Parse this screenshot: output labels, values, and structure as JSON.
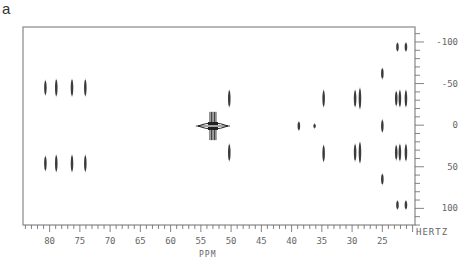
{
  "panel_label": "a",
  "chart_data": {
    "type": "scatter",
    "title": "",
    "subtitle": "2D NMR contour plot (J-resolved)",
    "xlabel": "PPM",
    "ylabel": "HERTZ",
    "xlim": [
      84.4,
      19.6
    ],
    "ylim": [
      -118,
      120
    ],
    "x_reversed": true,
    "x_ticks": [
      80,
      75,
      70,
      65,
      60,
      55,
      50,
      45,
      40,
      35,
      30,
      25
    ],
    "x_tick_labels": [
      "80",
      "75",
      "70",
      "65",
      "60",
      "55",
      "50",
      "45",
      "40",
      "35",
      "30",
      "25"
    ],
    "x_minor_step": 1,
    "y_ticks": [
      -100,
      -50,
      0,
      50,
      100
    ],
    "y_tick_labels": [
      "-100",
      "-50",
      "0",
      "50",
      "100"
    ],
    "y_minor_step": 10,
    "grid": false,
    "legend": null,
    "peaks": [
      {
        "ppm": 80.7,
        "hz": -45,
        "len": 14
      },
      {
        "ppm": 78.9,
        "hz": -45,
        "len": 16
      },
      {
        "ppm": 76.3,
        "hz": -45,
        "len": 16
      },
      {
        "ppm": 74.1,
        "hz": -45,
        "len": 16
      },
      {
        "ppm": 80.7,
        "hz": 46,
        "len": 14
      },
      {
        "ppm": 78.9,
        "hz": 46,
        "len": 16
      },
      {
        "ppm": 76.3,
        "hz": 46,
        "len": 16
      },
      {
        "ppm": 74.1,
        "hz": 46,
        "len": 16
      },
      {
        "ppm": 50.3,
        "hz": -32,
        "len": 16
      },
      {
        "ppm": 50.3,
        "hz": 33,
        "len": 16
      },
      {
        "ppm": 38.8,
        "hz": 1,
        "len": 8
      },
      {
        "ppm": 36.2,
        "hz": 1,
        "len": 4
      },
      {
        "ppm": 34.7,
        "hz": -32,
        "len": 16
      },
      {
        "ppm": 34.7,
        "hz": 34,
        "len": 16
      },
      {
        "ppm": 29.5,
        "hz": -32,
        "len": 16
      },
      {
        "ppm": 28.7,
        "hz": -32,
        "len": 20
      },
      {
        "ppm": 29.5,
        "hz": 33,
        "len": 16
      },
      {
        "ppm": 28.7,
        "hz": 33,
        "len": 20
      },
      {
        "ppm": 25.0,
        "hz": -62,
        "len": 10
      },
      {
        "ppm": 25.0,
        "hz": 1,
        "len": 12
      },
      {
        "ppm": 25.0,
        "hz": 65,
        "len": 10
      },
      {
        "ppm": 22.7,
        "hz": -32,
        "len": 14
      },
      {
        "ppm": 22.1,
        "hz": -32,
        "len": 16
      },
      {
        "ppm": 21.1,
        "hz": -32,
        "len": 16
      },
      {
        "ppm": 22.7,
        "hz": 33,
        "len": 14
      },
      {
        "ppm": 22.1,
        "hz": 33,
        "len": 16
      },
      {
        "ppm": 21.1,
        "hz": 33,
        "len": 16
      },
      {
        "ppm": 22.5,
        "hz": -94,
        "len": 8
      },
      {
        "ppm": 21.1,
        "hz": -94,
        "len": 8
      },
      {
        "ppm": 22.5,
        "hz": 96,
        "len": 8
      },
      {
        "ppm": 21.1,
        "hz": 96,
        "len": 8
      }
    ],
    "cross_peak": {
      "ppm": 53.0,
      "hz": 1,
      "h_extent_ppm": 2.5,
      "v_extent_hz": 17,
      "label": "strong multiplet at ~53 ppm"
    }
  },
  "style": {
    "frame_color": "#888888",
    "peak_color": "#222222",
    "background": "#ffffff"
  }
}
